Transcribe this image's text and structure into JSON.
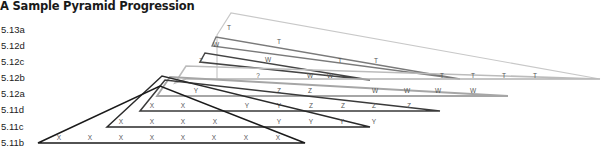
{
  "title": "A Sample Pyramid Progression",
  "grades": [
    {
      "label": "5.13a",
      "y": 30
    },
    {
      "label": "5.12d",
      "y": 46
    },
    {
      "label": "5.12c",
      "y": 62
    },
    {
      "label": "5.12b",
      "y": 78
    },
    {
      "label": "5.12a",
      "y": 94
    },
    {
      "label": "5.11d",
      "y": 110
    },
    {
      "label": "5.11c",
      "y": 127
    },
    {
      "label": "5.11b",
      "y": 143
    }
  ],
  "pyramids": [
    {
      "grade": "5.13a",
      "color": "#c8c8c8",
      "width": 1.2,
      "points": "217,35 231,13 600,79 217,79",
      "marks": [
        {
          "t": "T",
          "x": 229,
          "y": 30
        }
      ]
    },
    {
      "grade": "5.12d",
      "color": "#7a7a7a",
      "width": 1.4,
      "points": "212,46 216,37 460,79",
      "marks": [
        {
          "t": "W",
          "x": 216,
          "y": 47
        },
        {
          "t": "T",
          "x": 279,
          "y": 44
        }
      ]
    },
    {
      "grade": "5.12c",
      "color": "#444444",
      "width": 1.5,
      "points": "200,62 205,53 370,80",
      "marks": [
        {
          "t": "Z",
          "x": 201,
          "y": 63
        },
        {
          "t": "W",
          "x": 268,
          "y": 62
        },
        {
          "t": "T",
          "x": 340,
          "y": 63
        },
        {
          "t": "T",
          "x": 376,
          "y": 63
        }
      ]
    },
    {
      "grade": "5.12b",
      "color": "#bcbcbc",
      "width": 1.6,
      "points": "175,83 186,66 600,79 186,79",
      "marks": [
        {
          "t": "?",
          "x": 258,
          "y": 78
        },
        {
          "t": "W",
          "x": 310,
          "y": 78
        },
        {
          "t": "W",
          "x": 330,
          "y": 78
        },
        {
          "t": "T",
          "x": 442,
          "y": 78
        },
        {
          "t": "T",
          "x": 473,
          "y": 78
        },
        {
          "t": "T",
          "x": 504,
          "y": 78
        },
        {
          "t": "T",
          "x": 535,
          "y": 78
        }
      ]
    },
    {
      "grade": "5.12a",
      "color": "#a6a6a6",
      "width": 1.8,
      "points": "157,96 170,77 508,96",
      "marks": [
        {
          "t": "Y",
          "x": 196,
          "y": 93
        },
        {
          "t": "Z",
          "x": 279,
          "y": 93
        },
        {
          "t": "Z",
          "x": 310,
          "y": 93
        },
        {
          "t": "W",
          "x": 375,
          "y": 93
        },
        {
          "t": "W",
          "x": 407,
          "y": 93
        },
        {
          "t": "W",
          "x": 438,
          "y": 93
        },
        {
          "t": "W",
          "x": 473,
          "y": 93
        }
      ]
    },
    {
      "grade": "5.11d",
      "color": "#3a3a3a",
      "width": 1.5,
      "points": "140,111 165,80 440,111",
      "marks": [
        {
          "t": "X",
          "x": 152,
          "y": 108
        },
        {
          "t": "X",
          "x": 183,
          "y": 108
        },
        {
          "t": "Y",
          "x": 247,
          "y": 108
        },
        {
          "t": "Y",
          "x": 279,
          "y": 108
        },
        {
          "t": "Z",
          "x": 311,
          "y": 108
        },
        {
          "t": "Z",
          "x": 343,
          "y": 108
        },
        {
          "t": "Z",
          "x": 374,
          "y": 108
        },
        {
          "t": "Z",
          "x": 409,
          "y": 108
        }
      ]
    },
    {
      "grade": "5.11c",
      "color": "#2a2a2a",
      "width": 1.5,
      "points": "107,127 162,76 370,127",
      "marks": [
        {
          "t": "X",
          "x": 121,
          "y": 124
        },
        {
          "t": "X",
          "x": 152,
          "y": 124
        },
        {
          "t": "X",
          "x": 183,
          "y": 124
        },
        {
          "t": "X",
          "x": 215,
          "y": 124
        },
        {
          "t": "Y",
          "x": 279,
          "y": 124
        },
        {
          "t": "Y",
          "x": 311,
          "y": 124
        },
        {
          "t": "Y",
          "x": 342,
          "y": 124
        },
        {
          "t": "Y",
          "x": 374,
          "y": 124
        }
      ]
    },
    {
      "grade": "5.11b",
      "color": "#1a1a1a",
      "width": 1.5,
      "points": "38,143 160,86 305,143",
      "marks": [
        {
          "t": "X",
          "x": 59,
          "y": 140
        },
        {
          "t": "X",
          "x": 90,
          "y": 140
        },
        {
          "t": "X",
          "x": 121,
          "y": 140
        },
        {
          "t": "X",
          "x": 152,
          "y": 140
        },
        {
          "t": "X",
          "x": 183,
          "y": 140
        },
        {
          "t": "X",
          "x": 214,
          "y": 140
        },
        {
          "t": "X",
          "x": 246,
          "y": 140
        },
        {
          "t": "X",
          "x": 278,
          "y": 140
        }
      ]
    }
  ]
}
